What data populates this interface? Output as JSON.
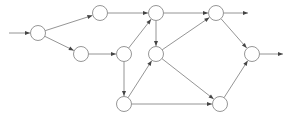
{
  "diagram": {
    "type": "directed-graph",
    "node_radius": 7.5,
    "colors": {
      "node_stroke": "#8a8a8a",
      "edge": "#7a7a7a",
      "arrowhead": "#444444",
      "background": "#ffffff"
    },
    "nodes": [
      {
        "id": "A",
        "x": 38,
        "y": 33
      },
      {
        "id": "B",
        "x": 100,
        "y": 13
      },
      {
        "id": "C",
        "x": 81,
        "y": 54
      },
      {
        "id": "D",
        "x": 124,
        "y": 54
      },
      {
        "id": "E",
        "x": 156,
        "y": 13
      },
      {
        "id": "F",
        "x": 156,
        "y": 54
      },
      {
        "id": "G",
        "x": 124,
        "y": 104
      },
      {
        "id": "H",
        "x": 216,
        "y": 13
      },
      {
        "id": "I",
        "x": 252,
        "y": 54
      },
      {
        "id": "J",
        "x": 220,
        "y": 104
      }
    ],
    "inputs": [
      {
        "to": "A",
        "from_x": 9,
        "from_y": 33
      }
    ],
    "outputs": [
      {
        "from": "H",
        "to_x": 248,
        "to_y": 13
      },
      {
        "from": "I",
        "to_x": 283,
        "to_y": 54
      }
    ],
    "edges": [
      {
        "from": "A",
        "to": "B"
      },
      {
        "from": "A",
        "to": "C"
      },
      {
        "from": "B",
        "to": "E"
      },
      {
        "from": "C",
        "to": "D"
      },
      {
        "from": "D",
        "to": "E"
      },
      {
        "from": "D",
        "to": "G"
      },
      {
        "from": "E",
        "to": "F"
      },
      {
        "from": "E",
        "to": "H"
      },
      {
        "from": "G",
        "to": "F"
      },
      {
        "from": "G",
        "to": "J"
      },
      {
        "from": "F",
        "to": "H"
      },
      {
        "from": "F",
        "to": "J"
      },
      {
        "from": "H",
        "to": "I"
      },
      {
        "from": "J",
        "to": "I"
      }
    ]
  }
}
